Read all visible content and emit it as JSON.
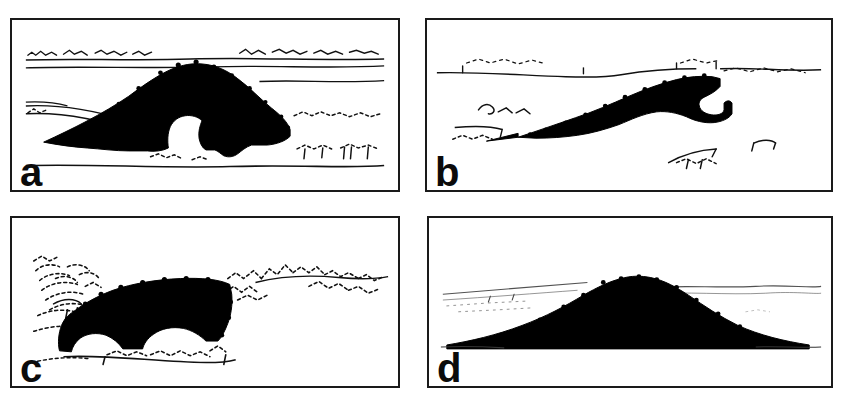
{
  "figure": {
    "background_color": "#ffffff",
    "ink_color": "#000000",
    "frame_color": "#1a1a1a",
    "panel_count": 4,
    "layout": "2x2 grid of framed line-drawing panels"
  },
  "panels": [
    {
      "id": "a",
      "label": "a",
      "position": "top-left",
      "caption_text": "a",
      "description": "Broad rounded dome silhouette with a white notch at lower centre, three thin horizon lines and dotted scrub texture",
      "silhouette_color": "#000000",
      "horizon_lines": 4,
      "mound_shape": "dome",
      "has_white_void": true
    },
    {
      "id": "b",
      "label": "b",
      "position": "top-right",
      "caption_text": "b",
      "description": "Elongated wedge rising from a sharp point at lower-left to a thick blunt terminus at right",
      "silhouette_color": "#000000",
      "horizon_lines": 2,
      "mound_shape": "wedge-ramp",
      "has_white_void": false
    },
    {
      "id": "c",
      "label": "c",
      "position": "bottom-left",
      "caption_text": "c",
      "description": "Blocky flat-topped mass with two rounded white voids along its base, heavy dotted scrub at left and right",
      "silhouette_color": "#000000",
      "horizon_lines": 2,
      "mound_shape": "flat-topped block",
      "has_white_void": true
    },
    {
      "id": "d",
      "label": "d",
      "position": "bottom-right",
      "caption_text": "d",
      "description": "Smooth symmetric trapezoidal mound with gently convex flanks and faint distant horizon lines",
      "silhouette_color": "#000000",
      "horizon_lines": 3,
      "mound_shape": "symmetric trapezoid",
      "has_white_void": false
    }
  ]
}
